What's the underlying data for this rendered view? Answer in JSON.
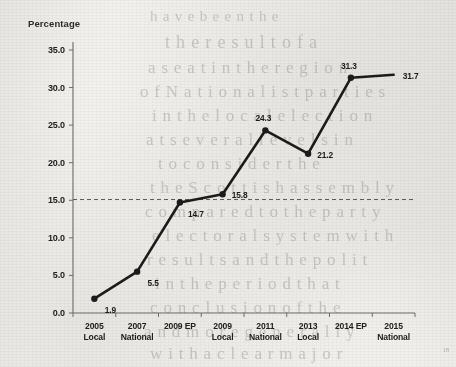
{
  "page": {
    "background_color": "#f4f3f0",
    "ink_color": "#1d1b19",
    "bleed_through_lines": [
      {
        "text": "h a v e   b e e n   t h e",
        "x": 150,
        "y": 8,
        "size": 15
      },
      {
        "text": "t h e   r e s u l t   o f   a",
        "x": 165,
        "y": 32,
        "size": 18
      },
      {
        "text": "a  s e a t   i n   t h e   r e g i o n",
        "x": 148,
        "y": 58,
        "size": 17
      },
      {
        "text": "o f   N a t i o n a l i s t   p a r t i e s",
        "x": 140,
        "y": 82,
        "size": 17
      },
      {
        "text": "i n   t h e   l o c a l   e l e c t i o n",
        "x": 152,
        "y": 106,
        "size": 17
      },
      {
        "text": "a t   s e v e r a l   l e v e l s   i n",
        "x": 146,
        "y": 130,
        "size": 17
      },
      {
        "text": "t o   c o n s i d e r   t h e",
        "x": 158,
        "y": 154,
        "size": 17
      },
      {
        "text": "t h e   S c o t t i s h   a s s e m b l y",
        "x": 150,
        "y": 178,
        "size": 17
      },
      {
        "text": "c o m p a r e d   t o   t h e   p a r t y",
        "x": 145,
        "y": 202,
        "size": 17
      },
      {
        "text": "e l e c t o r a l   s y s t e m   w i t h",
        "x": 152,
        "y": 226,
        "size": 17
      },
      {
        "text": "r e s u l t s   a n d   t h e   p o l i t",
        "x": 147,
        "y": 250,
        "size": 17
      },
      {
        "text": "i n   t h e   p e r i o d   t h a t",
        "x": 155,
        "y": 274,
        "size": 17
      },
      {
        "text": "c o n c l u s i o n   o f   t h e",
        "x": 150,
        "y": 298,
        "size": 17
      },
      {
        "text": "a n d   m o r e   g e n e r a l l y",
        "x": 144,
        "y": 322,
        "size": 17
      },
      {
        "text": "w i t h   a   c l e a r   m a j o r",
        "x": 150,
        "y": 344,
        "size": 17
      }
    ],
    "footnote_marker": "18"
  },
  "chart_data": {
    "type": "line",
    "title": "",
    "xlabel": "",
    "ylabel": "Percentage",
    "ylim": [
      0,
      35
    ],
    "yticks": [
      "0.0",
      "5.0",
      "10.0",
      "15.0",
      "20.0",
      "25.0",
      "30.0",
      "35.0"
    ],
    "ytick_values": [
      0,
      5,
      10,
      15,
      20,
      25,
      30,
      35
    ],
    "grid": false,
    "legend": "none",
    "categories": [
      "2005\nLocal",
      "2007\nNational",
      "2009 EP",
      "2009\nLocal",
      "2011\nNational",
      "2013\nLocal",
      "2014 EP",
      "2015\nNational"
    ],
    "values": [
      1.9,
      5.5,
      14.7,
      15.8,
      24.3,
      21.2,
      31.3,
      31.7
    ],
    "point_labels": [
      "1.9",
      "5.5",
      "14.7",
      "15.8",
      "24.3",
      "21.2",
      "31.3",
      "31.7"
    ],
    "label_positions": [
      "below-right",
      "below-right",
      "below-right",
      "right",
      "above-left",
      "right",
      "above-left",
      "right"
    ],
    "markers": [
      true,
      true,
      true,
      true,
      true,
      true,
      true,
      false
    ],
    "series_color": "#1d1b19",
    "reference_line": {
      "value": 15.1,
      "style": "dashed",
      "color": "#5a5854"
    }
  }
}
